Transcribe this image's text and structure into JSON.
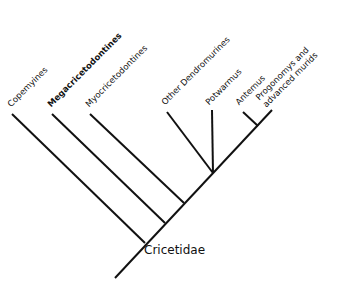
{
  "diagram": {
    "type": "cladogram",
    "root": {
      "label": "Cricetidae"
    },
    "taxa": [
      {
        "id": "copemyines",
        "label": "Copemyines"
      },
      {
        "id": "megacricetodontines",
        "label": "Megacricetodontines"
      },
      {
        "id": "myocricetodontines",
        "label": "Myocricetodontines"
      },
      {
        "id": "other-dendromurines",
        "label": "Other Dendromurines"
      },
      {
        "id": "potwarmus",
        "label": "Potwarmus"
      },
      {
        "id": "antemus",
        "label": "Antemus"
      },
      {
        "id": "progonomys",
        "label": "Progonomys and\nadvanced murids"
      }
    ],
    "line_color": "#111111",
    "background": "#ffffff"
  }
}
